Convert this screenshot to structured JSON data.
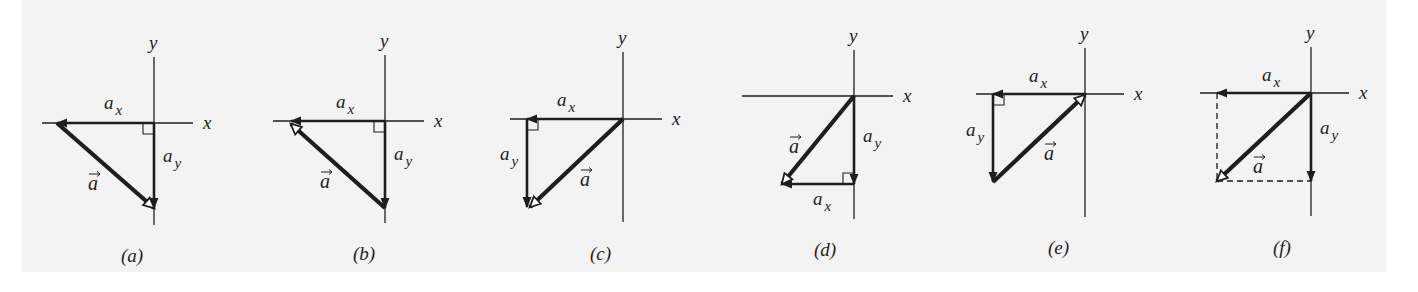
{
  "figure": {
    "background": "#f3f3f3",
    "ink": "#1e1e1e",
    "axis_labels": {
      "x": "x",
      "y": "y"
    },
    "vector_label": "a",
    "component_labels": {
      "x": "a",
      "x_sub": "x",
      "y": "a",
      "y_sub": "y"
    },
    "panels": [
      {
        "id": "a",
        "caption": "(a)",
        "origin": [
          154,
          123
        ],
        "xaxis": [
          42,
          193
        ],
        "yaxis": [
          57,
          225
        ],
        "ax": {
          "from": [
            154,
            123
          ],
          "to": [
            57,
            123
          ]
        },
        "ay": {
          "from": [
            154,
            123
          ],
          "to": [
            154,
            208
          ]
        },
        "a": {
          "from": [
            57,
            123
          ],
          "to": [
            154,
            208
          ]
        },
        "right_angle": [
          154,
          123,
          -1,
          1
        ],
        "label_ax": [
          104,
          109
        ],
        "label_ay": [
          163,
          162
        ],
        "label_a": [
          88,
          190
        ],
        "caption_pos": [
          121,
          262
        ]
      },
      {
        "id": "b",
        "caption": "(b)",
        "origin": [
          385,
          121
        ],
        "xaxis": [
          273,
          424
        ],
        "yaxis": [
          55,
          223
        ],
        "ax": {
          "from": [
            385,
            121
          ],
          "to": [
            291,
            121
          ]
        },
        "ay": {
          "from": [
            385,
            121
          ],
          "to": [
            385,
            208
          ]
        },
        "a": {
          "from": [
            385,
            208
          ],
          "to": [
            291,
            124
          ]
        },
        "right_angle": [
          385,
          121,
          -1,
          1
        ],
        "label_ax": [
          336,
          108
        ],
        "label_ay": [
          394,
          160
        ],
        "label_a": [
          320,
          188
        ],
        "caption_pos": [
          353,
          260
        ]
      },
      {
        "id": "c",
        "caption": "(c)",
        "origin": [
          623,
          119
        ],
        "xaxis": [
          510,
          662
        ],
        "yaxis": [
          52,
          222
        ],
        "ax": {
          "from": [
            623,
            119
          ],
          "to": [
            527,
            119
          ]
        },
        "ay": {
          "from": [
            527,
            119
          ],
          "to": [
            527,
            207
          ]
        },
        "a": {
          "from": [
            623,
            119
          ],
          "to": [
            530,
            207
          ]
        },
        "right_angle": [
          527,
          119,
          1,
          1
        ],
        "label_ax": [
          557,
          106
        ],
        "label_ay": [
          500,
          160
        ],
        "label_a": [
          580,
          186
        ],
        "caption_pos": [
          590,
          260
        ]
      },
      {
        "id": "d",
        "caption": "(d)",
        "origin": [
          854,
          96
        ],
        "xaxis": [
          742,
          893
        ],
        "yaxis": [
          50,
          219
        ],
        "ax": {
          "from": [
            854,
            184
          ],
          "to": [
            782,
            184
          ]
        },
        "ay": {
          "from": [
            854,
            96
          ],
          "to": [
            854,
            184
          ]
        },
        "a": {
          "from": [
            854,
            96
          ],
          "to": [
            782,
            184
          ]
        },
        "right_angle": [
          854,
          184,
          -1,
          -1
        ],
        "label_ax": [
          813,
          205
        ],
        "label_ay": [
          863,
          142
        ],
        "label_a": [
          789,
          153
        ],
        "caption_pos": [
          814,
          256
        ]
      },
      {
        "id": "e",
        "caption": "(e)",
        "origin": [
          1085,
          94
        ],
        "xaxis": [
          976,
          1124
        ],
        "yaxis": [
          48,
          217
        ],
        "ax": {
          "from": [
            1085,
            94
          ],
          "to": [
            993,
            94
          ]
        },
        "ay": {
          "from": [
            993,
            94
          ],
          "to": [
            993,
            182
          ]
        },
        "a": {
          "from": [
            993,
            182
          ],
          "to": [
            1085,
            95
          ]
        },
        "right_angle": [
          993,
          94,
          1,
          1
        ],
        "label_ax": [
          1029,
          82
        ],
        "label_ay": [
          966,
          136
        ],
        "label_a": [
          1044,
          160
        ],
        "caption_pos": [
          1048,
          254
        ]
      },
      {
        "id": "f",
        "caption": "(f)",
        "origin": [
          1311,
          93
        ],
        "xaxis": [
          1200,
          1349
        ],
        "yaxis": [
          47,
          216
        ],
        "ax": {
          "from": [
            1311,
            93
          ],
          "to": [
            1217,
            93
          ]
        },
        "ay": {
          "from": [
            1311,
            93
          ],
          "to": [
            1311,
            181
          ]
        },
        "a": {
          "from": [
            1311,
            93
          ],
          "to": [
            1217,
            181
          ]
        },
        "dashed": [
          [
            1217,
            93,
            1217,
            181
          ],
          [
            1217,
            181,
            1311,
            181
          ]
        ],
        "label_ax": [
          1262,
          81
        ],
        "label_ay": [
          1320,
          134
        ],
        "label_a": [
          1253,
          173
        ],
        "caption_pos": [
          1273,
          254
        ]
      }
    ]
  }
}
